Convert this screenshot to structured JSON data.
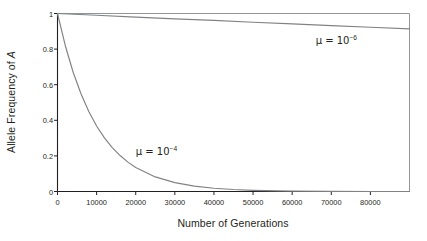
{
  "chart_data": {
    "type": "line",
    "title": "",
    "xlabel": "Number of Generations",
    "ylabel_plain": "Allele Frequency of A",
    "ylabel_prefix": "Allele Frequency of ",
    "ylabel_italic": "A",
    "xlim": [
      0,
      90000
    ],
    "ylim": [
      0,
      1
    ],
    "xticks": [
      0,
      10000,
      20000,
      30000,
      40000,
      50000,
      60000,
      70000,
      80000
    ],
    "xticklabels": [
      "0",
      "10000",
      "20000",
      "30000",
      "40000",
      "50000",
      "60000",
      "70000",
      "80000"
    ],
    "yticks": [
      0,
      0.2,
      0.4,
      0.6,
      0.8,
      1
    ],
    "yticklabels": [
      "0",
      "0.2",
      "0.4",
      "0.6",
      "0.8",
      "1"
    ],
    "grid": false,
    "legend_position": "inline-annotation",
    "line_color": "#808285",
    "axis_color": "#231f20",
    "background": "#ffffff",
    "series": [
      {
        "name": "mu = 10^-4",
        "mu": 0.0001,
        "model": "p(t) = exp(-mu * t)",
        "annotation": {
          "text_prefix": "μ = 10",
          "exponent": "−4",
          "x": 20000,
          "y": 0.22
        },
        "x": [
          0,
          2000,
          4000,
          6000,
          8000,
          10000,
          12000,
          14000,
          16000,
          18000,
          20000,
          25000,
          30000,
          35000,
          40000,
          45000,
          50000,
          60000,
          70000,
          80000,
          90000
        ],
        "values": [
          1.0,
          0.819,
          0.67,
          0.549,
          0.449,
          0.368,
          0.301,
          0.247,
          0.202,
          0.165,
          0.135,
          0.082,
          0.05,
          0.03,
          0.018,
          0.011,
          0.0067,
          0.0025,
          0.0009,
          0.0003,
          0.0001
        ]
      },
      {
        "name": "mu = 10^-6",
        "mu": 1e-06,
        "model": "p(t) = exp(-mu * t)",
        "annotation": {
          "text_prefix": "μ = 10",
          "exponent": "−6",
          "x": 66000,
          "y": 0.845
        },
        "x": [
          0,
          10000,
          20000,
          30000,
          40000,
          50000,
          60000,
          70000,
          80000,
          90000
        ],
        "values": [
          1.0,
          0.99,
          0.98,
          0.97,
          0.961,
          0.951,
          0.942,
          0.932,
          0.923,
          0.914
        ]
      }
    ]
  }
}
